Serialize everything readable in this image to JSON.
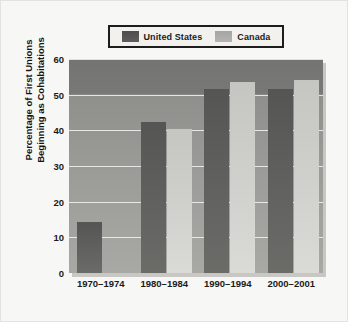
{
  "chart_data": {
    "type": "bar",
    "title": "",
    "subtitle": "",
    "xlabel": "",
    "ylabel": "Percentage of First Unions Beginning as Cohabitations",
    "ylabel_lines": [
      "Percentage of First Unions",
      "Beginning as Cohabitations"
    ],
    "categories": [
      "1970–1974",
      "1980–1984",
      "1990–1994",
      "2000–2001"
    ],
    "series": [
      {
        "name": "United States",
        "color": "#5c5c5a",
        "values": [
          14.3,
          42.3,
          51.5,
          51.5
        ]
      },
      {
        "name": "Canada",
        "color": "#cdcdca",
        "values": [
          0,
          40.3,
          53.5,
          54.2
        ]
      }
    ],
    "ylim": [
      0,
      60
    ],
    "yticks": [
      0,
      10,
      20,
      30,
      40,
      50,
      60
    ],
    "ytick_labels": [
      "0",
      "10",
      "20",
      "30",
      "40",
      "50",
      "60"
    ],
    "grid": true,
    "grid_axis": "y",
    "legend": {
      "position": "top",
      "entries": [
        {
          "label": "United States",
          "swatch": "dark-gray-swatch"
        },
        {
          "label": "Canada",
          "swatch": "light-gray-swatch"
        }
      ]
    },
    "colors": {
      "figure_background": "#f7f7f5",
      "plot_background_top": "#747472",
      "plot_background_bottom": "#a8a8a5",
      "gridline": "#f5f5f2",
      "legend_border": "#1d1d1d",
      "text": "#1b1b1b"
    }
  }
}
